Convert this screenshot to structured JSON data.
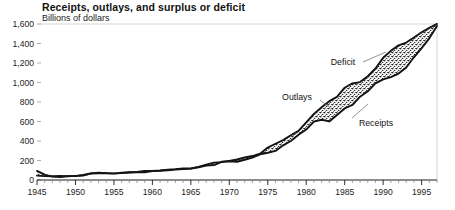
{
  "chart_data": {
    "type": "area",
    "title": "Receipts, outlays, and surplus or deficit",
    "subtitle": "Billions of dollars",
    "xlabel": "",
    "ylabel": "Billions of dollars",
    "ylim": [
      0,
      1600
    ],
    "xlim": [
      1945,
      1997
    ],
    "grid": false,
    "legend_position": "inline-annotations",
    "ytick_labels": [
      "0",
      "200",
      "400",
      "600",
      "800",
      "1,000",
      "1,200",
      "1,400",
      "1,600"
    ],
    "ytick_values": [
      0,
      200,
      400,
      600,
      800,
      1000,
      1200,
      1400,
      1600
    ],
    "xtick_labels": [
      "1945",
      "1950",
      "1955",
      "1960",
      "1965",
      "1970",
      "1975",
      "1980",
      "1985",
      "1990",
      "1995"
    ],
    "xtick_values": [
      1945,
      1950,
      1955,
      1960,
      1965,
      1970,
      1975,
      1980,
      1985,
      1990,
      1995
    ],
    "xtick_minor_step": 1,
    "annotations": [
      {
        "label": "Deficit",
        "x": 1985,
        "y": 1180
      },
      {
        "label": "Outlays",
        "x": 1977,
        "y": 760
      },
      {
        "label": "Receipts",
        "x": 1988,
        "y": 560
      }
    ],
    "x": [
      1945,
      1946,
      1947,
      1948,
      1949,
      1950,
      1951,
      1952,
      1953,
      1954,
      1955,
      1956,
      1957,
      1958,
      1959,
      1960,
      1961,
      1962,
      1963,
      1964,
      1965,
      1966,
      1967,
      1968,
      1969,
      1970,
      1971,
      1972,
      1973,
      1974,
      1975,
      1976,
      1977,
      1978,
      1979,
      1980,
      1981,
      1982,
      1983,
      1984,
      1985,
      1986,
      1987,
      1988,
      1989,
      1990,
      1991,
      1992,
      1993,
      1994,
      1995,
      1996,
      1997
    ],
    "series": [
      {
        "name": "Outlays",
        "values": [
          92.7,
          55.2,
          34.5,
          29.8,
          38.8,
          42.6,
          45.5,
          67.7,
          76.1,
          70.9,
          68.4,
          70.6,
          76.6,
          82.4,
          92.1,
          92.2,
          97.7,
          106.8,
          111.3,
          118.5,
          118.2,
          134.5,
          157.5,
          178.1,
          183.6,
          195.6,
          210.2,
          230.7,
          245.7,
          269.4,
          332.3,
          371.8,
          409.2,
          458.7,
          504.0,
          590.9,
          678.2,
          745.7,
          808.4,
          851.8,
          946.4,
          990.4,
          1004.0,
          1064.4,
          1143.7,
          1253.0,
          1324.2,
          1381.5,
          1409.4,
          1461.7,
          1515.7,
          1560.5,
          1601.2
        ]
      },
      {
        "name": "Receipts",
        "values": [
          45.2,
          39.3,
          38.5,
          41.6,
          39.4,
          39.4,
          51.6,
          66.2,
          69.6,
          69.7,
          65.5,
          74.6,
          80.0,
          79.6,
          79.2,
          92.5,
          94.4,
          99.7,
          106.6,
          112.6,
          116.8,
          130.8,
          148.8,
          153.0,
          186.9,
          192.8,
          187.1,
          207.3,
          230.8,
          263.2,
          279.1,
          298.1,
          355.6,
          399.6,
          463.3,
          517.1,
          599.3,
          617.8,
          600.6,
          666.5,
          734.1,
          769.2,
          854.4,
          909.3,
          991.2,
          1032.0,
          1055.0,
          1091.3,
          1154.4,
          1258.6,
          1351.8,
          1453.1,
          1579.3
        ]
      }
    ]
  },
  "annotation_labels": {
    "deficit": "Deficit",
    "outlays": "Outlays",
    "receipts": "Receipts"
  }
}
